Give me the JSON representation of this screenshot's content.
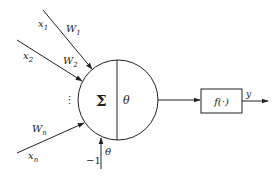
{
  "diagram": {
    "type": "artificial-neuron-model",
    "inputs": [
      {
        "x_label": "x",
        "x_sub": "1",
        "w_label": "W",
        "w_sub": "1"
      },
      {
        "x_label": "x",
        "x_sub": "2",
        "w_label": "W",
        "w_sub": "2"
      },
      {
        "x_label": "x",
        "x_sub": "n",
        "w_label": "W",
        "w_sub": "n"
      }
    ],
    "ellipsis": "⋮",
    "neuron": {
      "sum_symbol": "Σ",
      "threshold_symbol": "θ"
    },
    "bias": {
      "input_label": "−1",
      "weight_label": "θ"
    },
    "activation": {
      "label": "f(·)"
    },
    "output": {
      "label": "y"
    },
    "colors": {
      "stroke": "#222222",
      "background": "#ffffff"
    }
  }
}
